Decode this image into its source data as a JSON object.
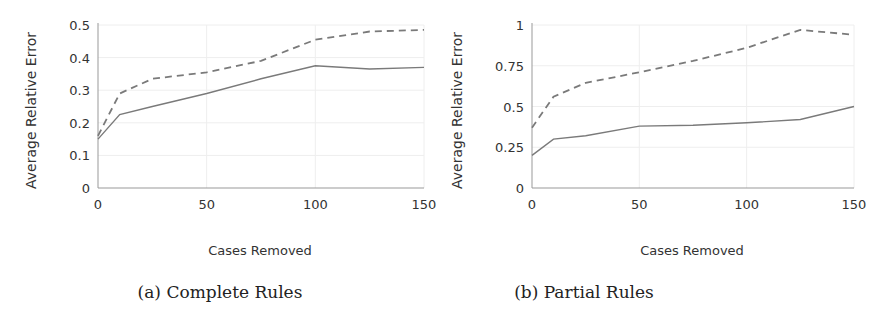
{
  "chart_data": [
    {
      "type": "line",
      "caption": "(a) Complete Rules",
      "title": "",
      "xlabel": "Cases Removed",
      "ylabel": "Average Relative Error",
      "x": [
        0,
        10,
        25,
        50,
        75,
        100,
        125,
        150
      ],
      "xticks": [
        "0",
        "50",
        "100",
        "150"
      ],
      "yticks": [
        "0",
        "0.1",
        "0.2",
        "0.3",
        "0.4",
        "0.5"
      ],
      "xlim": [
        0,
        150
      ],
      "ylim": [
        0,
        0.5
      ],
      "grid": true,
      "legend": null,
      "series": [
        {
          "name": "solid",
          "style": "solid",
          "values": [
            0.15,
            0.225,
            0.25,
            0.29,
            0.335,
            0.375,
            0.365,
            0.37
          ]
        },
        {
          "name": "dashed",
          "style": "dashed",
          "values": [
            0.16,
            0.29,
            0.335,
            0.355,
            0.39,
            0.455,
            0.48,
            0.485
          ]
        }
      ]
    },
    {
      "type": "line",
      "caption": "(b) Partial Rules",
      "title": "",
      "xlabel": "Cases Removed",
      "ylabel": "Average Relative Error",
      "x": [
        0,
        10,
        25,
        50,
        75,
        100,
        125,
        150
      ],
      "xticks": [
        "0",
        "50",
        "100",
        "150"
      ],
      "yticks": [
        "0",
        "0.25",
        "0.5",
        "0.75",
        "1"
      ],
      "xlim": [
        0,
        150
      ],
      "ylim": [
        0,
        1
      ],
      "grid": true,
      "legend": null,
      "series": [
        {
          "name": "solid",
          "style": "solid",
          "values": [
            0.2,
            0.3,
            0.32,
            0.38,
            0.385,
            0.4,
            0.42,
            0.5
          ]
        },
        {
          "name": "dashed",
          "style": "dashed",
          "values": [
            0.37,
            0.56,
            0.645,
            0.71,
            0.78,
            0.86,
            0.97,
            0.94
          ]
        }
      ]
    }
  ],
  "colors": {
    "line": "#7a7a7a",
    "axis": "#999999",
    "grid": "#eeeeee",
    "text": "#333333"
  }
}
